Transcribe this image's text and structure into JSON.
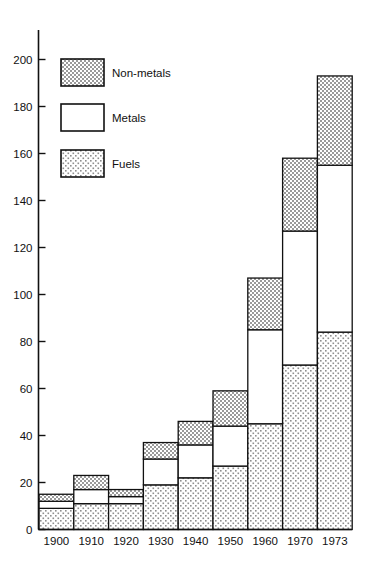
{
  "chart_data": {
    "type": "bar",
    "subtype": "stacked-bar",
    "title": "",
    "subtitle": "",
    "xlabel": "",
    "ylabel": "",
    "categories": [
      "1900",
      "1910",
      "1920",
      "1930",
      "1940",
      "1950",
      "1960",
      "1970",
      "1973"
    ],
    "series": [
      {
        "name": "Fuels",
        "values": [
          9,
          11,
          11,
          19,
          22,
          27,
          45,
          70,
          84
        ]
      },
      {
        "name": "Metals",
        "values": [
          3,
          6,
          3,
          11,
          14,
          17,
          40,
          57,
          71
        ]
      },
      {
        "name": "Non-metals",
        "values": [
          3,
          6,
          3,
          7,
          10,
          15,
          22,
          31,
          38
        ]
      }
    ],
    "stack_totals": [
      15,
      23,
      17,
      37,
      46,
      59,
      107,
      158,
      193
    ],
    "ylim": [
      0,
      200
    ],
    "ytick_step": 20,
    "ytick_labels": [
      "0",
      "20",
      "40",
      "60",
      "80",
      "100",
      "120",
      "140",
      "160",
      "180",
      "200"
    ],
    "xtick_labels": [
      "1900",
      "1910",
      "1920",
      "1930",
      "1940",
      "1950",
      "1960",
      "1970",
      "1973"
    ],
    "grid": false,
    "legend_position": "upper-left-inside",
    "legend": [
      {
        "label": "Non-metals",
        "pattern": "dense-dotted",
        "color": "#b8b8b8"
      },
      {
        "label": "Metals",
        "pattern": "solid-white",
        "color": "#ffffff"
      },
      {
        "label": "Fuels",
        "pattern": "sparse-dotted",
        "color": "#e4e4e4"
      }
    ],
    "axis_color": "#111111",
    "background_color": "#ffffff"
  }
}
